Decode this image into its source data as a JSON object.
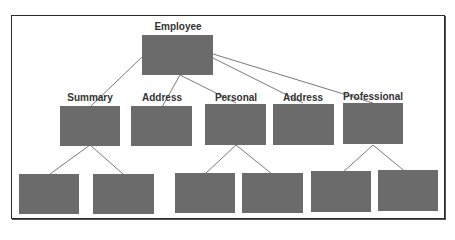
{
  "diagram": {
    "type": "hierarchy",
    "root": {
      "label": "Employee"
    },
    "level2": [
      {
        "label": "Summary",
        "children": 2
      },
      {
        "label": "Address",
        "children": 0
      },
      {
        "label": "Personal",
        "children": 2
      },
      {
        "label": "Address",
        "children": 0
      },
      {
        "label": "Professional",
        "children": 2
      }
    ],
    "level3_count": 6,
    "colors": {
      "box": "#6b6b6b",
      "line": "#777777",
      "border": "#2a2a2a"
    }
  }
}
